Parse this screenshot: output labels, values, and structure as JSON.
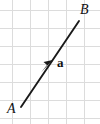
{
  "figure": {
    "name": "vector-diagram",
    "width": 100,
    "height": 124,
    "background_color": "#ffffff"
  },
  "grid": {
    "color": "#dcdcdc",
    "cell_size": 18,
    "vertical_lines_x": [
      12,
      30,
      48,
      66,
      84
    ],
    "horizontal_lines_y": [
      10,
      28,
      46,
      64,
      82,
      100,
      118
    ]
  },
  "vector": {
    "color": "#1a1a1a",
    "start_point": {
      "x": 21,
      "y": 107
    },
    "end_point": {
      "x": 79,
      "y": 21
    },
    "arrowhead": {
      "x": 50,
      "y": 64,
      "position": "midpoint",
      "direction": "up-right"
    },
    "stroke_width": 1.9
  },
  "labels": {
    "start": "A",
    "end": "B",
    "vector": "a"
  }
}
